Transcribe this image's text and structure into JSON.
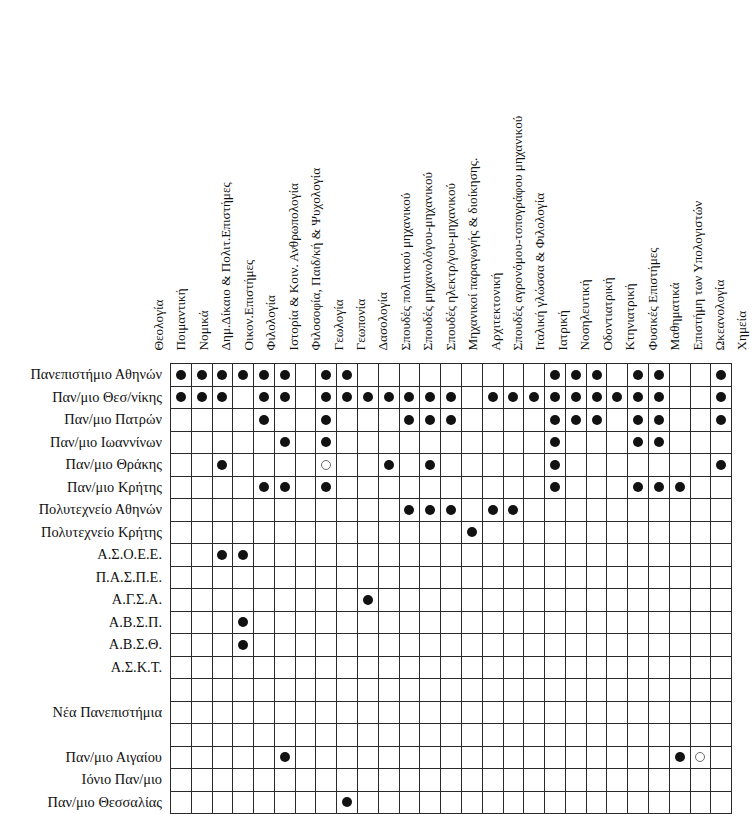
{
  "chart_data": {
    "type": "heatmap",
    "title": "",
    "xlabel": "",
    "ylabel": "",
    "legend": {
      "filled": "Τμήμα λειτουργεί",
      "hollow": "Τμήμα υπό ίδρυση / μερική λειτουργία"
    },
    "categories": [
      "Θεολογία",
      "Ποιμαντική",
      "Νομικά",
      "Δημ.Δίκαιο & Πολιτ.Επιστήμες",
      "Οικον.Επιστήμες",
      "Φιλολογία",
      "Ιστορία & Κοιν. Ανθρωπολογία",
      "Φιλοσοφία, Παιδ/κή & Ψυχολογία",
      "Γεωλογία",
      "Γεωπονία",
      "Δασολογία",
      "Σπουδές πολιτικού μηχανικού",
      "Σπουδές μηχανολόγου-μηχανικού",
      "Σπουδές ηλεκτρ/γου-μηχανικού",
      "Μηχανικοί παραγωγής & διοίκησης.",
      "Αρχιτεκτονική",
      "Σπουδές αγρονόμου-τοπογράφου μηχανικού",
      "Ιταλική γλώσσα & Φιλολογία",
      "Ιατρική",
      "Νοσηλευτική",
      "Οδοντιατρική",
      "Κτηνιατρική",
      "Φυσικές Επιστήμες",
      "Μαθηματικά",
      "Επιστήμη των Υπολογιστών",
      "Ωκεανολογία",
      "Χημεία"
    ],
    "rows": [
      {
        "label": "Πανεπιστήμιο Αθηνών",
        "group": "old",
        "cells": [
          "f",
          "f",
          "f",
          "f",
          "f",
          "f",
          "",
          "f",
          "f",
          "",
          "",
          "",
          "",
          "",
          "",
          "",
          "",
          "",
          "f",
          "f",
          "f",
          "",
          "f",
          "f",
          "",
          "",
          "f"
        ]
      },
      {
        "label": "Παν/μιο Θεσ/νίκης",
        "group": "old",
        "cells": [
          "f",
          "f",
          "f",
          "",
          "f",
          "f",
          "",
          "f",
          "f",
          "f",
          "f",
          "f",
          "f",
          "f",
          "",
          "f",
          "f",
          "f",
          "f",
          "f",
          "f",
          "f",
          "f",
          "f",
          "",
          "",
          "f"
        ]
      },
      {
        "label": "Παν/μιο Πατρών",
        "group": "old",
        "cells": [
          "",
          "",
          "",
          "",
          "f",
          "",
          "",
          "f",
          "",
          "",
          "",
          "f",
          "f",
          "f",
          "",
          "",
          "",
          "",
          "f",
          "f",
          "f",
          "",
          "f",
          "f",
          "",
          "",
          "f"
        ]
      },
      {
        "label": "Παν/μιο Ιωαννίνων",
        "group": "old",
        "cells": [
          "",
          "",
          "",
          "",
          "",
          "f",
          "",
          "f",
          "",
          "",
          "",
          "",
          "",
          "",
          "",
          "",
          "",
          "",
          "f",
          "",
          "",
          "",
          "f",
          "f",
          "",
          "",
          ""
        ]
      },
      {
        "label": "Παν/μιο Θράκης",
        "group": "old",
        "cells": [
          "",
          "",
          "f",
          "",
          "",
          "",
          "",
          "h",
          "",
          "",
          "f",
          "",
          "f",
          "",
          "",
          "",
          "",
          "",
          "f",
          "",
          "",
          "",
          "",
          "",
          "",
          "",
          "f"
        ]
      },
      {
        "label": "Παν/μιο Κρήτης",
        "group": "old",
        "cells": [
          "",
          "",
          "",
          "",
          "f",
          "f",
          "",
          "f",
          "",
          "",
          "",
          "",
          "",
          "",
          "",
          "",
          "",
          "",
          "f",
          "",
          "",
          "",
          "f",
          "f",
          "f",
          "",
          ""
        ]
      },
      {
        "label": "Πολυτεχνείο Αθηνών",
        "group": "old",
        "cells": [
          "",
          "",
          "",
          "",
          "",
          "",
          "",
          "",
          "",
          "",
          "",
          "f",
          "f",
          "f",
          "",
          "f",
          "f",
          "",
          "",
          "",
          "",
          "",
          "",
          "",
          "",
          "",
          ""
        ]
      },
      {
        "label": "Πολυτεχνείο Κρήτης",
        "group": "old",
        "cells": [
          "",
          "",
          "",
          "",
          "",
          "",
          "",
          "",
          "",
          "",
          "",
          "",
          "",
          "",
          "f",
          "",
          "",
          "",
          "",
          "",
          "",
          "",
          "",
          "",
          "",
          "",
          ""
        ]
      },
      {
        "label": "Α.Σ.Ο.Ε.Ε.",
        "group": "old",
        "cells": [
          "",
          "",
          "f",
          "f",
          "",
          "",
          "",
          "",
          "",
          "",
          "",
          "",
          "",
          "",
          "",
          "",
          "",
          "",
          "",
          "",
          "",
          "",
          "",
          "",
          "",
          "",
          ""
        ]
      },
      {
        "label": "Π.Α.Σ.Π.Ε.",
        "group": "old",
        "cells": [
          "",
          "",
          "",
          "",
          "",
          "",
          "",
          "",
          "",
          "",
          "",
          "",
          "",
          "",
          "",
          "",
          "",
          "",
          "",
          "",
          "",
          "",
          "",
          "",
          "",
          "",
          ""
        ]
      },
      {
        "label": "Α.Γ.Σ.Α.",
        "group": "old",
        "cells": [
          "",
          "",
          "",
          "",
          "",
          "",
          "",
          "",
          "",
          "f",
          "",
          "",
          "",
          "",
          "",
          "",
          "",
          "",
          "",
          "",
          "",
          "",
          "",
          "",
          "",
          "",
          ""
        ]
      },
      {
        "label": "Α.Β.Σ.Π.",
        "group": "old",
        "cells": [
          "",
          "",
          "",
          "f",
          "",
          "",
          "",
          "",
          "",
          "",
          "",
          "",
          "",
          "",
          "",
          "",
          "",
          "",
          "",
          "",
          "",
          "",
          "",
          "",
          "",
          "",
          ""
        ]
      },
      {
        "label": "Α.Β.Σ.Θ.",
        "group": "old",
        "cells": [
          "",
          "",
          "",
          "f",
          "",
          "",
          "",
          "",
          "",
          "",
          "",
          "",
          "",
          "",
          "",
          "",
          "",
          "",
          "",
          "",
          "",
          "",
          "",
          "",
          "",
          "",
          ""
        ]
      },
      {
        "label": "Α.Σ.Κ.Τ.",
        "group": "old",
        "cells": [
          "",
          "",
          "",
          "",
          "",
          "",
          "",
          "",
          "",
          "",
          "",
          "",
          "",
          "",
          "",
          "",
          "",
          "",
          "",
          "",
          "",
          "",
          "",
          "",
          "",
          "",
          ""
        ]
      },
      {
        "label": "",
        "group": "spacer",
        "cells": [
          "",
          "",
          "",
          "",
          "",
          "",
          "",
          "",
          "",
          "",
          "",
          "",
          "",
          "",
          "",
          "",
          "",
          "",
          "",
          "",
          "",
          "",
          "",
          "",
          "",
          "",
          ""
        ]
      },
      {
        "label": "Νέα Πανεπιστήμια",
        "group": "heading",
        "cells": [
          "",
          "",
          "",
          "",
          "",
          "",
          "",
          "",
          "",
          "",
          "",
          "",
          "",
          "",
          "",
          "",
          "",
          "",
          "",
          "",
          "",
          "",
          "",
          "",
          "",
          "",
          ""
        ]
      },
      {
        "label": "",
        "group": "spacer",
        "cells": [
          "",
          "",
          "",
          "",
          "",
          "",
          "",
          "",
          "",
          "",
          "",
          "",
          "",
          "",
          "",
          "",
          "",
          "",
          "",
          "",
          "",
          "",
          "",
          "",
          "",
          "",
          ""
        ]
      },
      {
        "label": "Παν/μιο Αιγαίου",
        "group": "new",
        "cells": [
          "",
          "",
          "",
          "",
          "",
          "f",
          "",
          "",
          "",
          "",
          "",
          "",
          "",
          "",
          "",
          "",
          "",
          "",
          "",
          "",
          "",
          "",
          "",
          "",
          "f",
          "h",
          ""
        ]
      },
      {
        "label": "Ιόνιο Παν/μιο",
        "group": "new",
        "cells": [
          "",
          "",
          "",
          "",
          "",
          "",
          "",
          "",
          "",
          "",
          "",
          "",
          "",
          "",
          "",
          "",
          "",
          "",
          "",
          "",
          "",
          "",
          "",
          "",
          "",
          "",
          ""
        ]
      },
      {
        "label": "Παν/μιο Θεσσαλίας",
        "group": "new",
        "cells": [
          "",
          "",
          "",
          "",
          "",
          "",
          "",
          "",
          "f",
          "",
          "",
          "",
          "",
          "",
          "",
          "",
          "",
          "",
          "",
          "",
          "",
          "",
          "",
          "",
          "",
          "",
          ""
        ]
      }
    ]
  }
}
